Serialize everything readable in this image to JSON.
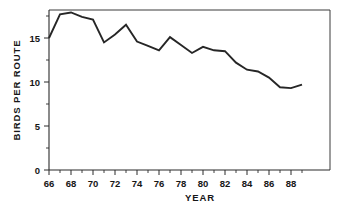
{
  "chart_data": {
    "type": "line",
    "title": "",
    "subtitle": "",
    "xlabel": "YEAR",
    "ylabel": "BIRDS  PER  ROUTE",
    "xlim": [
      1966,
      1989
    ],
    "ylim": [
      0,
      18.7
    ],
    "grid": false,
    "legend": null,
    "legend_position": "none",
    "x_tick_labels": [
      "66",
      "68",
      "70",
      "72",
      "74",
      "76",
      "78",
      "80",
      "82",
      "84",
      "86",
      "88"
    ],
    "x_tick_values": [
      1966,
      1968,
      1970,
      1972,
      1974,
      1976,
      1978,
      1980,
      1982,
      1984,
      1986,
      1988
    ],
    "x_minor_tick_values": [
      1967,
      1969,
      1971,
      1973,
      1975,
      1977,
      1979,
      1981,
      1983,
      1985,
      1987,
      1989
    ],
    "y_tick_labels": [
      "0",
      "5",
      "10",
      "15"
    ],
    "y_tick_values": [
      0,
      5,
      10,
      15
    ],
    "y_minor_tick_values": [
      2.5,
      7.5,
      12.5,
      17.5
    ],
    "x": [
      1966,
      1967,
      1968,
      1969,
      1970,
      1971,
      1972,
      1973,
      1974,
      1975,
      1976,
      1977,
      1978,
      1979,
      1980,
      1981,
      1982,
      1983,
      1984,
      1985,
      1986,
      1987,
      1988,
      1989
    ],
    "values": [
      15.0,
      17.7,
      17.9,
      17.4,
      17.1,
      14.5,
      15.4,
      16.5,
      14.6,
      14.1,
      13.6,
      15.1,
      14.2,
      13.3,
      14.0,
      13.6,
      13.5,
      12.2,
      11.4,
      11.2,
      10.5,
      9.4,
      9.3,
      9.7
    ],
    "series": [
      {
        "name": "Birds per route",
        "values": [
          15.0,
          17.7,
          17.9,
          17.4,
          17.1,
          14.5,
          15.4,
          16.5,
          14.6,
          14.1,
          13.6,
          15.1,
          14.2,
          13.3,
          14.0,
          13.6,
          13.5,
          12.2,
          11.4,
          11.2,
          10.5,
          9.4,
          9.3,
          9.7
        ],
        "color": "#262626"
      }
    ],
    "annotations": [],
    "colors": {
      "line": "#262626",
      "axis": "#2b2b2b",
      "frame": "#3a3a3a",
      "text": "#161616",
      "background": "#ffffff"
    }
  },
  "axes": {
    "x_axis_title": "YEAR",
    "y_axis_title": "BIRDS  PER  ROUTE"
  }
}
